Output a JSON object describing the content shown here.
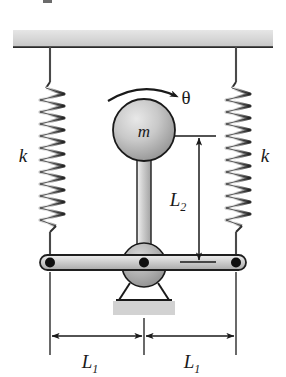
{
  "figure": {
    "type": "mechanical-system-diagram",
    "caption_fragment": ""
  },
  "labels": {
    "spring_left": "k",
    "spring_right": "k",
    "mass": "m",
    "angle": "θ",
    "vertical_dimension": "L",
    "vertical_dimension_sub": "2",
    "horizontal_dimension_left": "L",
    "horizontal_dimension_left_sub": "1",
    "horizontal_dimension_right": "L",
    "horizontal_dimension_right_sub": "1"
  },
  "components": {
    "ceiling": {
      "name": "fixed-support-ceiling",
      "fill": "#d2d2d2",
      "edge": "#2b2b2b"
    },
    "spring_left": {
      "name": "left-coil-spring",
      "coils": 20,
      "stiffness_symbol": "k"
    },
    "spring_right": {
      "name": "right-coil-spring",
      "coils": 20,
      "stiffness_symbol": "k"
    },
    "disk": {
      "name": "disk-mass",
      "symbol": "m",
      "fill_light": "#d8d8d8",
      "fill_dark": "#9a9a9a",
      "edge": "#1a1a1a"
    },
    "rod": {
      "name": "connecting-rod",
      "fill": "#c4c4c4",
      "edge": "#2b2b2b"
    },
    "hub": {
      "name": "pivot-hub",
      "fill": "#b0b0b0",
      "edge": "#1a1a1a"
    },
    "bar": {
      "name": "horizontal-rocker-bar",
      "fill": "#c4c4c4",
      "edge": "#1f1f1f"
    },
    "pivot_center": {
      "name": "center-pivot-point",
      "fill": "#101010"
    },
    "pivot_left": {
      "name": "left-bar-pivot-point",
      "fill": "#101010"
    },
    "pivot_right": {
      "name": "right-bar-pivot-point",
      "fill": "#101010"
    },
    "bracket": {
      "name": "support-bracket",
      "edge": "#1a1a1a"
    },
    "ground": {
      "name": "ground-base-block",
      "fill": "#d2d2d2"
    },
    "rotation_arrow": {
      "name": "rotation-direction-arrow",
      "direction": "clockwise",
      "stroke": "#1a1a1a"
    }
  },
  "colors": {
    "line": "#1a1a1a",
    "metal_light": "#e2e2e2",
    "metal_mid": "#c4c4c4",
    "metal_dark": "#8f8f8f",
    "background": "#ffffff"
  }
}
